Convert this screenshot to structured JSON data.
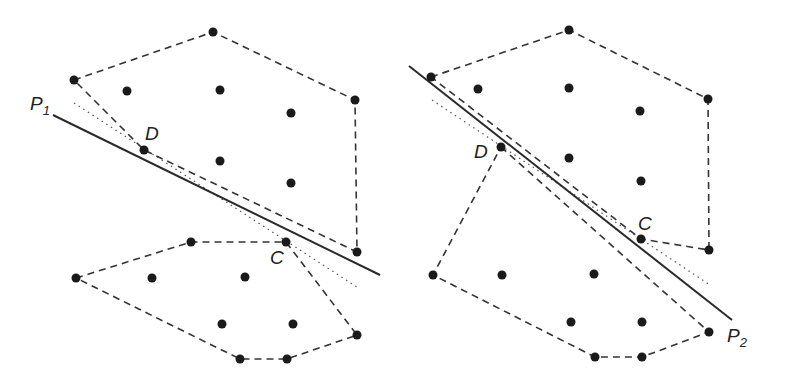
{
  "panels": [
    {
      "id": "left",
      "line_label": "P",
      "line_sub": "1",
      "point_labels": {
        "D": "D",
        "C": "C"
      },
      "hulls": [
        [
          [
            74,
            80
          ],
          [
            213,
            32
          ],
          [
            355,
            100
          ],
          [
            357,
            252
          ],
          [
            144,
            150
          ],
          [
            74,
            80
          ]
        ],
        [
          [
            76,
            278
          ],
          [
            191,
            242
          ],
          [
            286,
            242
          ],
          [
            357,
            335
          ],
          [
            287,
            359
          ],
          [
            240,
            359
          ],
          [
            76,
            278
          ]
        ]
      ],
      "solid_line": [
        [
          53,
          115
        ],
        [
          380,
          275
        ]
      ],
      "dotted_line": [
        [
          74,
          103
        ],
        [
          357,
          287
        ]
      ],
      "points": [
        [
          213,
          32
        ],
        [
          74,
          80
        ],
        [
          127,
          91
        ],
        [
          220,
          90
        ],
        [
          355,
          100
        ],
        [
          291,
          113
        ],
        [
          144,
          150
        ],
        [
          220,
          161
        ],
        [
          291,
          183
        ],
        [
          357,
          252
        ],
        [
          191,
          242
        ],
        [
          286,
          242
        ],
        [
          76,
          278
        ],
        [
          152,
          278
        ],
        [
          245,
          277
        ],
        [
          222,
          324
        ],
        [
          293,
          324
        ],
        [
          357,
          335
        ],
        [
          240,
          359
        ],
        [
          287,
          359
        ]
      ]
    },
    {
      "id": "right",
      "line_label": "P",
      "line_sub": "2",
      "point_labels": {
        "D": "D",
        "C": "C"
      },
      "hulls": [
        [
          [
            431,
            77
          ],
          [
            569,
            30
          ],
          [
            708,
            99
          ],
          [
            709,
            250
          ],
          [
            641,
            239
          ],
          [
            431,
            77
          ]
        ],
        [
          [
            501,
            147
          ],
          [
            709,
            332
          ],
          [
            642,
            357
          ],
          [
            595,
            357
          ],
          [
            433,
            275
          ],
          [
            501,
            147
          ]
        ]
      ],
      "solid_line": [
        [
          409,
          66
        ],
        [
          732,
          320
        ]
      ],
      "dotted_line": [
        [
          432,
          100
        ],
        [
          710,
          285
        ]
      ],
      "points": [
        [
          569,
          30
        ],
        [
          431,
          77
        ],
        [
          478,
          89
        ],
        [
          569,
          88
        ],
        [
          708,
          99
        ],
        [
          640,
          111
        ],
        [
          501,
          147
        ],
        [
          569,
          158
        ],
        [
          641,
          181
        ],
        [
          641,
          239
        ],
        [
          709,
          250
        ],
        [
          433,
          275
        ],
        [
          502,
          275
        ],
        [
          594,
          274
        ],
        [
          571,
          322
        ],
        [
          642,
          322
        ],
        [
          709,
          332
        ],
        [
          595,
          357
        ],
        [
          642,
          357
        ]
      ]
    }
  ],
  "labels": {
    "p1": "P",
    "p1_sub": "1",
    "p2": "P",
    "p2_sub": "2",
    "left_D": "D",
    "left_C": "C",
    "right_D": "D",
    "right_C": "C"
  }
}
